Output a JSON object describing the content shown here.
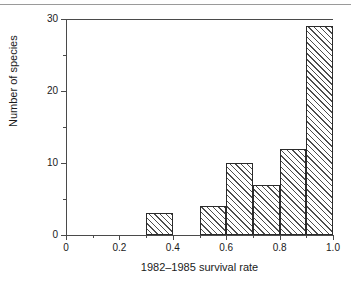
{
  "chart_data": {
    "type": "bar",
    "title": "",
    "xlabel": "1982–1985 survival rate",
    "ylabel": "Number of species",
    "xlim": [
      0,
      1.0
    ],
    "ylim": [
      0,
      30
    ],
    "grid": false,
    "legend": null,
    "bin_width": 0.1,
    "bin_edges": [
      0.0,
      0.1,
      0.2,
      0.3,
      0.4,
      0.5,
      0.6,
      0.7,
      0.8,
      0.9,
      1.0
    ],
    "categories": [
      "0.0-0.1",
      "0.1-0.2",
      "0.2-0.3",
      "0.3-0.4",
      "0.4-0.5",
      "0.5-0.6",
      "0.6-0.7",
      "0.7-0.8",
      "0.8-0.9",
      "0.9-1.0"
    ],
    "values": [
      0,
      0,
      0,
      3,
      0,
      4,
      10,
      7,
      12,
      29
    ],
    "bars": [
      {
        "x0": 0.3,
        "x1": 0.4,
        "value": 3
      },
      {
        "x0": 0.5,
        "x1": 0.6,
        "value": 4
      },
      {
        "x0": 0.6,
        "x1": 0.7,
        "value": 10
      },
      {
        "x0": 0.7,
        "x1": 0.8,
        "value": 7
      },
      {
        "x0": 0.8,
        "x1": 0.9,
        "value": 12
      },
      {
        "x0": 0.9,
        "x1": 1.0,
        "value": 29
      }
    ],
    "x_ticks_major": [
      "0",
      "0.2",
      "0.4",
      "0.6",
      "0.8",
      "1.0"
    ],
    "x_ticks_major_values": [
      0,
      0.2,
      0.4,
      0.6,
      0.8,
      1.0
    ],
    "x_ticks_minor_values": [
      0.1,
      0.3,
      0.5,
      0.7,
      0.9
    ],
    "y_ticks_major": [
      "0",
      "10",
      "20",
      "30"
    ],
    "y_ticks_major_values": [
      0,
      10,
      20,
      30
    ],
    "y_ticks_minor_values": [
      5,
      15,
      25
    ]
  },
  "style": {
    "bar_edge_color": "#2b2b2b",
    "bar_hatch_color": "#4d4d4d",
    "axis_color": "#4a4a4a",
    "text_color": "#1a1a1a",
    "background": "#ffffff"
  }
}
